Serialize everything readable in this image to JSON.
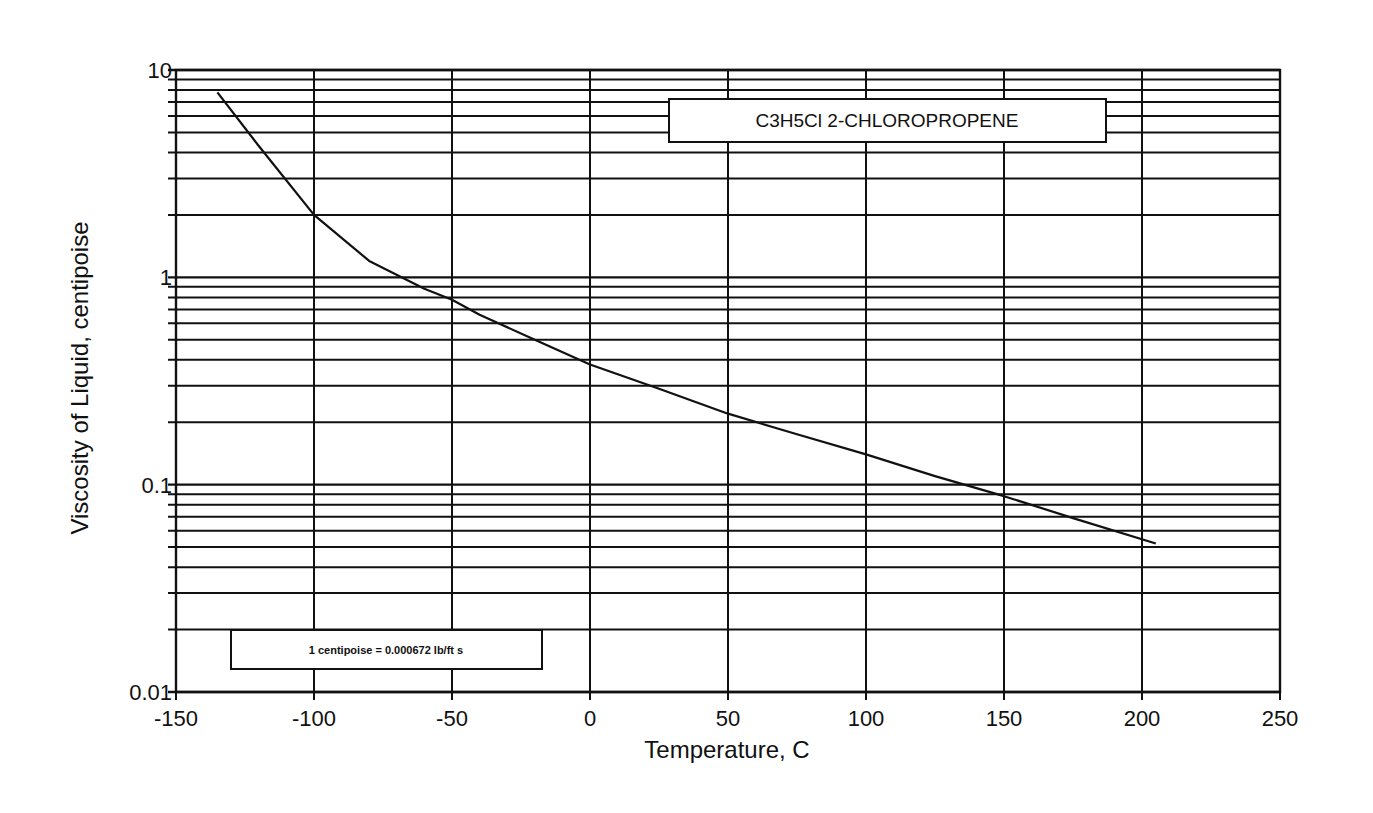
{
  "chart_data": {
    "type": "line",
    "title": "C3H5Cl  2-CHLOROPROPENE",
    "xlabel": "Temperature, C",
    "ylabel": "Viscosity of Liquid, centipoise",
    "xlim": [
      -150,
      250
    ],
    "ylim": [
      0.01,
      10
    ],
    "yscale": "log",
    "grid": true,
    "x_ticks": [
      -150,
      -100,
      -50,
      0,
      50,
      100,
      150,
      200,
      250
    ],
    "x_tick_labels": [
      "-150",
      "-100",
      "-50",
      "0",
      "50",
      "100",
      "150",
      "200",
      "250"
    ],
    "y_ticks": [
      0.01,
      0.1,
      1,
      10
    ],
    "y_tick_labels": [
      "0.01",
      "0.1",
      "1",
      "10"
    ],
    "annotations": [
      "1 centipoise = 0.000672 lb/ft s"
    ],
    "series": [
      {
        "name": "2-Chloropropene liquid viscosity",
        "x": [
          -135,
          -120,
          -100,
          -80,
          -60,
          -50,
          -40,
          -20,
          0,
          25,
          50,
          75,
          100,
          125,
          150,
          175,
          205
        ],
        "values": [
          7.8,
          4.3,
          2.0,
          1.2,
          0.88,
          0.78,
          0.66,
          0.5,
          0.38,
          0.29,
          0.22,
          0.175,
          0.14,
          0.11,
          0.088,
          0.069,
          0.052
        ]
      }
    ]
  },
  "title_box": {
    "text": "C3H5Cl  2-CHLOROPROPENE"
  },
  "note_box": {
    "text": "1 centipoise = 0.000672 lb/ft s"
  },
  "axes": {
    "x_title": "Temperature, C",
    "y_title": "Viscosity of Liquid, centipoise"
  }
}
